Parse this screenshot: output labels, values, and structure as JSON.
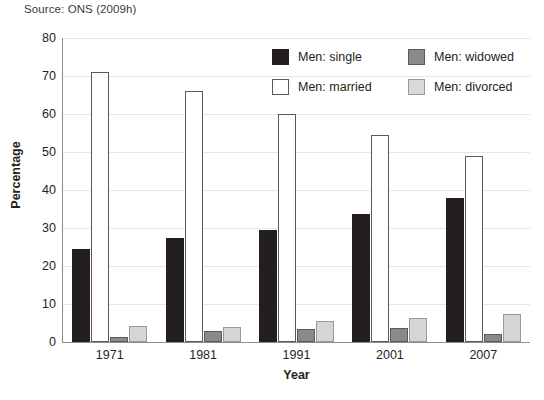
{
  "source_note": "Source: ONS (2009h)",
  "legend": {
    "entries": [
      {
        "key": "single",
        "label": "Men: single",
        "color": "#231f20"
      },
      {
        "key": "married",
        "label": "Men: married",
        "color": "#ffffff"
      },
      {
        "key": "widowed",
        "label": "Men: widowed",
        "color": "#8a8a8a"
      },
      {
        "key": "divorced",
        "label": "Men: divorced",
        "color": "#d9d9d9"
      }
    ]
  },
  "chart_data": {
    "type": "bar",
    "title": "",
    "xlabel": "Year",
    "ylabel": "Percentage",
    "categories": [
      "1971",
      "1981",
      "1991",
      "2001",
      "2007"
    ],
    "ylim": [
      0,
      80
    ],
    "yticks": [
      0,
      10,
      20,
      30,
      40,
      50,
      60,
      70,
      80
    ],
    "grid": true,
    "legend_position": "top-right-inside",
    "series": [
      {
        "name": "Men: single",
        "color": "#231f20",
        "values": [
          24.5,
          27.4,
          29.5,
          33.8,
          37.8
        ]
      },
      {
        "name": "Men: married",
        "color": "#ffffff",
        "values": [
          71.0,
          66.0,
          60.0,
          54.5,
          49.0
        ]
      },
      {
        "name": "Men: widowed",
        "color": "#8a8a8a",
        "values": [
          1.2,
          3.0,
          3.5,
          3.6,
          2.2
        ]
      },
      {
        "name": "Men: divorced",
        "color": "#d6d6d6",
        "values": [
          4.2,
          4.0,
          5.4,
          6.4,
          7.5
        ]
      }
    ]
  }
}
